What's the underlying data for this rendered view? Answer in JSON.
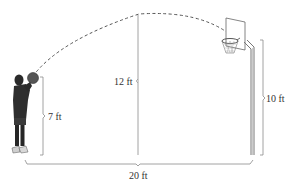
{
  "diagram": {
    "type": "basketball-shot-trajectory",
    "labels": {
      "release_height": "7 ft",
      "max_height": "12 ft",
      "hoop_height": "10 ft",
      "horizontal_distance": "20 ft"
    },
    "colors": {
      "line": "#8a8a8a",
      "dash": "#555555",
      "player": "#2a2a2a",
      "background": "#ffffff"
    }
  }
}
